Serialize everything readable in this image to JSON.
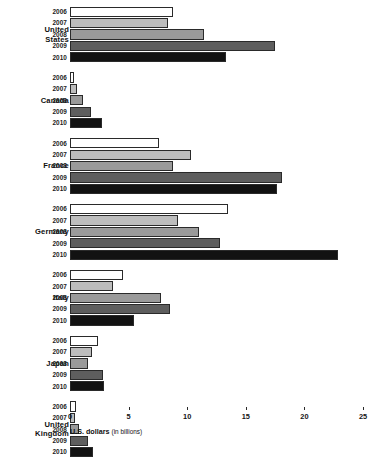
{
  "chart_data": {
    "type": "bar",
    "orientation": "horizontal",
    "title": "",
    "xlabel": "U.S. dollars (in billions)",
    "xlabel_main": "U.S. dollars",
    "xlabel_unit": "(in billions)",
    "ylabel": "",
    "xlim": [
      0,
      25
    ],
    "xticks": [
      0,
      5,
      10,
      15,
      20,
      25
    ],
    "xtick_labels": [
      "0",
      "5",
      "10",
      "15",
      "20",
      "25"
    ],
    "grid": false,
    "legend": "none",
    "categories": [
      "United States",
      "Canada",
      "France",
      "Germany",
      "Italy",
      "Japan",
      "United Kingdom"
    ],
    "series": [
      {
        "name": "2006",
        "color": "#ffffff",
        "values": [
          8.8,
          0.3,
          7.6,
          13.5,
          4.5,
          2.4,
          0.5
        ]
      },
      {
        "name": "2007",
        "color": "#bdbdbd",
        "values": [
          8.4,
          0.6,
          10.3,
          9.2,
          3.7,
          1.9,
          0.4
        ]
      },
      {
        "name": "2008",
        "color": "#9a9a9a",
        "values": [
          11.4,
          1.1,
          8.8,
          11.0,
          7.8,
          1.5,
          0.8
        ]
      },
      {
        "name": "2009",
        "color": "#5e5e5e",
        "values": [
          17.5,
          1.8,
          18.1,
          12.8,
          8.5,
          2.8,
          1.5
        ]
      },
      {
        "name": "2010",
        "color": "#121212",
        "values": [
          13.3,
          2.7,
          17.7,
          22.9,
          5.5,
          2.9,
          2.0
        ]
      }
    ],
    "groups": [
      {
        "label": "United States",
        "label_lines": [
          "United",
          "States"
        ],
        "bars": [
          {
            "year": "2006",
            "value": 8.8
          },
          {
            "year": "2007",
            "value": 8.4
          },
          {
            "year": "2008",
            "value": 11.4
          },
          {
            "year": "2009",
            "value": 17.5
          },
          {
            "year": "2010",
            "value": 13.3
          }
        ]
      },
      {
        "label": "Canada",
        "label_lines": [
          "Canada"
        ],
        "bars": [
          {
            "year": "2006",
            "value": 0.3
          },
          {
            "year": "2007",
            "value": 0.6
          },
          {
            "year": "2008",
            "value": 1.1
          },
          {
            "year": "2009",
            "value": 1.8
          },
          {
            "year": "2010",
            "value": 2.7
          }
        ]
      },
      {
        "label": "France",
        "label_lines": [
          "France"
        ],
        "bars": [
          {
            "year": "2006",
            "value": 7.6
          },
          {
            "year": "2007",
            "value": 10.3
          },
          {
            "year": "2008",
            "value": 8.8
          },
          {
            "year": "2009",
            "value": 18.1
          },
          {
            "year": "2010",
            "value": 17.7
          }
        ]
      },
      {
        "label": "Germany",
        "label_lines": [
          "Germany"
        ],
        "bars": [
          {
            "year": "2006",
            "value": 13.5
          },
          {
            "year": "2007",
            "value": 9.2
          },
          {
            "year": "2008",
            "value": 11.0
          },
          {
            "year": "2009",
            "value": 12.8
          },
          {
            "year": "2010",
            "value": 22.9
          }
        ]
      },
      {
        "label": "Italy",
        "label_lines": [
          "Italy"
        ],
        "bars": [
          {
            "year": "2006",
            "value": 4.5
          },
          {
            "year": "2007",
            "value": 3.7
          },
          {
            "year": "2008",
            "value": 7.8
          },
          {
            "year": "2009",
            "value": 8.5
          },
          {
            "year": "2010",
            "value": 5.5
          }
        ]
      },
      {
        "label": "Japan",
        "label_lines": [
          "Japan"
        ],
        "bars": [
          {
            "year": "2006",
            "value": 2.4
          },
          {
            "year": "2007",
            "value": 1.9
          },
          {
            "year": "2008",
            "value": 1.5
          },
          {
            "year": "2009",
            "value": 2.8
          },
          {
            "year": "2010",
            "value": 2.9
          }
        ]
      },
      {
        "label": "United Kingdom",
        "label_lines": [
          "United",
          "Kingdom"
        ],
        "bars": [
          {
            "year": "2006",
            "value": 0.5
          },
          {
            "year": "2007",
            "value": 0.4
          },
          {
            "year": "2008",
            "value": 0.8
          },
          {
            "year": "2009",
            "value": 1.5
          },
          {
            "year": "2010",
            "value": 2.0
          }
        ]
      }
    ]
  }
}
